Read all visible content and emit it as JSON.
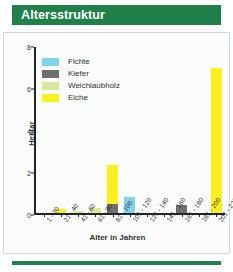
{
  "header": {
    "title": "Altersstruktur"
  },
  "colors": {
    "header_green": "#1f8049",
    "fichte": "#7fd4ec",
    "kiefer": "#6e6e6e",
    "weichlaubholz": "#d8e89a",
    "eiche": "#fbf01e",
    "axis": "#20242a",
    "plot_background": "#fbfdfd"
  },
  "chart_data": {
    "type": "bar",
    "title": "Altersstruktur",
    "stacked": true,
    "xlabel": "Alter in Jahren",
    "ylabel": "Hektar",
    "ylim": [
      0,
      8
    ],
    "yticks": [
      0,
      2,
      4,
      6,
      8
    ],
    "grid": false,
    "legend_position": "upper-left",
    "categories": [
      "1 - 20",
      "21 - 40",
      "41 - 60",
      "61 - 80",
      "81 - 100",
      "101 - 120",
      "121 - 140",
      "141 - 160",
      "161 - 180",
      "181 - 200",
      "201 - 220"
    ],
    "series": [
      {
        "name": "Fichte",
        "color": "#7fd4ec",
        "values": [
          0,
          0,
          0,
          0,
          0,
          0.75,
          0,
          0,
          0,
          0,
          0
        ]
      },
      {
        "name": "Kiefer",
        "color": "#6e6e6e",
        "values": [
          0,
          0,
          0,
          0,
          0.45,
          0,
          0,
          0,
          0.4,
          0,
          0
        ]
      },
      {
        "name": "Weichlaubholz",
        "color": "#d8e89a",
        "values": [
          0,
          0,
          0.1,
          0.25,
          0,
          0,
          0,
          0,
          0,
          0,
          0
        ]
      },
      {
        "name": "Eiche",
        "color": "#fbf01e",
        "values": [
          0,
          0.18,
          0,
          0,
          1.85,
          0,
          0,
          0,
          0,
          0,
          7.0
        ]
      }
    ]
  },
  "footer": {
    "rule": ""
  }
}
